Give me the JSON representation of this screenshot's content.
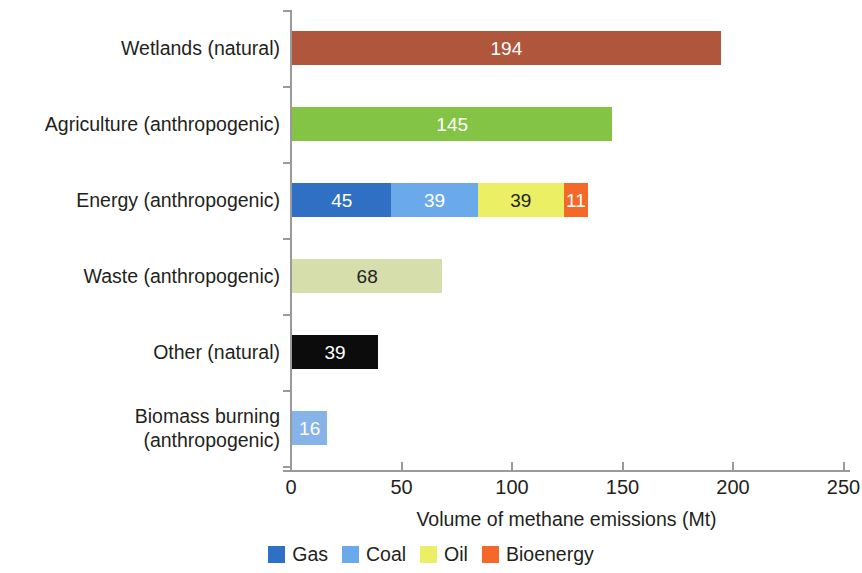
{
  "chart_data": {
    "type": "bar",
    "orientation": "horizontal",
    "stacked": true,
    "title": "",
    "xlabel": "Volume of methane emissions (Mt)",
    "ylabel": "",
    "xlim": [
      0,
      250
    ],
    "xticks": [
      0,
      50,
      100,
      150,
      200,
      250
    ],
    "xtick_labels": [
      "0",
      "50",
      "100",
      "150",
      "200",
      "250"
    ],
    "grid": false,
    "legend_position": "bottom",
    "categories": [
      "Wetlands (natural)",
      "Agriculture (anthropogenic)",
      "Energy (anthropogenic)",
      "Waste (anthropogenic)",
      "Other (natural)",
      "Biomass burning (anthropogenic)"
    ],
    "bars": [
      {
        "category": "Wetlands (natural)",
        "total": 194,
        "segments": [
          {
            "label": "194",
            "value": 194,
            "color": "#b0563c",
            "text_color": "#ffffff",
            "series": ""
          }
        ]
      },
      {
        "category": "Agriculture (anthropogenic)",
        "total": 145,
        "segments": [
          {
            "label": "145",
            "value": 145,
            "color": "#84c444",
            "text_color": "#ffffff",
            "series": ""
          }
        ]
      },
      {
        "category": "Energy (anthropogenic)",
        "total": 134,
        "segments": [
          {
            "label": "45",
            "value": 45,
            "color": "#2f6fc4",
            "text_color": "#ffffff",
            "series": "Gas"
          },
          {
            "label": "39",
            "value": 39,
            "color": "#6aaaea",
            "text_color": "#ffffff",
            "series": "Coal"
          },
          {
            "label": "39",
            "value": 39,
            "color": "#eaef64",
            "text_color": "#231f20",
            "series": "Oil"
          },
          {
            "label": "11",
            "value": 11,
            "color": "#f4692a",
            "text_color": "#ffffff",
            "series": "Bioenergy"
          }
        ]
      },
      {
        "category": "Waste (anthropogenic)",
        "total": 68,
        "segments": [
          {
            "label": "68",
            "value": 68,
            "color": "#d6dfac",
            "text_color": "#231f20",
            "series": ""
          }
        ]
      },
      {
        "category": "Other (natural)",
        "total": 39,
        "segments": [
          {
            "label": "39",
            "value": 39,
            "color": "#0d0c0c",
            "text_color": "#ffffff",
            "series": ""
          }
        ]
      },
      {
        "category": "Biomass burning (anthropogenic)",
        "total": 16,
        "segments": [
          {
            "label": "16",
            "value": 16,
            "color": "#86b3e8",
            "text_color": "#ffffff",
            "series": ""
          }
        ]
      }
    ],
    "series": [
      {
        "name": "Gas",
        "color": "#2f6fc4"
      },
      {
        "name": "Coal",
        "color": "#6aaaea"
      },
      {
        "name": "Oil",
        "color": "#eaef64"
      },
      {
        "name": "Bioenergy",
        "color": "#f4692a"
      }
    ]
  },
  "axis": {
    "x_title": "Volume of methane emissions (Mt)",
    "tick_labels": [
      "0",
      "50",
      "100",
      "150",
      "200",
      "250"
    ]
  },
  "category_labels": [
    {
      "line1": "Wetlands (natural)",
      "line2": ""
    },
    {
      "line1": "Agriculture (anthropogenic)",
      "line2": ""
    },
    {
      "line1": "Energy (anthropogenic)",
      "line2": ""
    },
    {
      "line1": "Waste (anthropogenic)",
      "line2": ""
    },
    {
      "line1": "Other (natural)",
      "line2": ""
    },
    {
      "line1": "Biomass burning",
      "line2": "(anthropogenic)"
    }
  ],
  "legend": {
    "items": [
      {
        "label": "Gas",
        "color": "#2f6fc4"
      },
      {
        "label": "Coal",
        "color": "#6aaaea"
      },
      {
        "label": "Oil",
        "color": "#eaef64"
      },
      {
        "label": "Bioenergy",
        "color": "#f4692a"
      }
    ]
  },
  "colors": {
    "axis": "#9a9a9a",
    "text": "#231f20",
    "background": "#ffffff",
    "wetlands": "#b0563c",
    "agriculture": "#84c444",
    "waste": "#d6dfac",
    "other": "#0d0c0c",
    "biomass": "#86b3e8"
  }
}
